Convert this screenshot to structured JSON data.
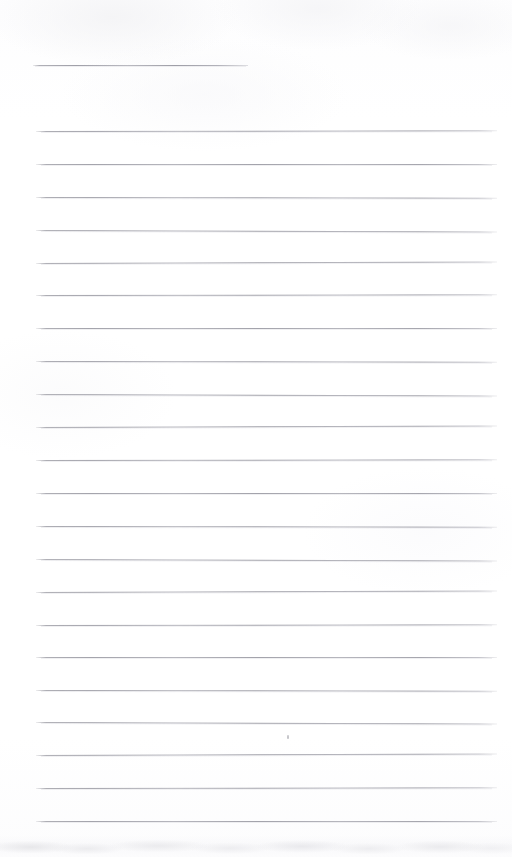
{
  "document": {
    "kind": "scanned-blank-lined-page",
    "page_width": 512,
    "page_height": 857,
    "paper_color": "#ffffff",
    "rule_color": "#a4a4ac",
    "text_content": "",
    "visible_text_lines": []
  },
  "ruling": {
    "line_start_x": 36,
    "line_end_x": 497,
    "line_spacing": 32.9,
    "first_full_line_y": 131,
    "full_line_count": 22,
    "line_thickness": 1
  },
  "partial_rule": {
    "label": "short-top-rule",
    "y": 65,
    "start_x": 33,
    "end_x": 248
  },
  "lines": [
    {
      "index": 1,
      "y": 131,
      "x1": 36,
      "x2": 497
    },
    {
      "index": 2,
      "y": 164,
      "x1": 36,
      "x2": 497
    },
    {
      "index": 3,
      "y": 197,
      "x1": 36,
      "x2": 497
    },
    {
      "index": 4,
      "y": 230,
      "x1": 36,
      "x2": 497
    },
    {
      "index": 5,
      "y": 263,
      "x1": 36,
      "x2": 497
    },
    {
      "index": 6,
      "y": 295,
      "x1": 36,
      "x2": 497
    },
    {
      "index": 7,
      "y": 328,
      "x1": 36,
      "x2": 497
    },
    {
      "index": 8,
      "y": 361,
      "x1": 36,
      "x2": 497
    },
    {
      "index": 9,
      "y": 394,
      "x1": 36,
      "x2": 497
    },
    {
      "index": 10,
      "y": 427,
      "x1": 36,
      "x2": 497
    },
    {
      "index": 11,
      "y": 460,
      "x1": 36,
      "x2": 497
    },
    {
      "index": 12,
      "y": 493,
      "x1": 36,
      "x2": 497
    },
    {
      "index": 13,
      "y": 526,
      "x1": 36,
      "x2": 497
    },
    {
      "index": 14,
      "y": 559,
      "x1": 36,
      "x2": 497
    },
    {
      "index": 15,
      "y": 592,
      "x1": 36,
      "x2": 497
    },
    {
      "index": 16,
      "y": 625,
      "x1": 36,
      "x2": 497
    },
    {
      "index": 17,
      "y": 657,
      "x1": 36,
      "x2": 497
    },
    {
      "index": 18,
      "y": 690,
      "x1": 36,
      "x2": 497
    },
    {
      "index": 19,
      "y": 722,
      "x1": 36,
      "x2": 497
    },
    {
      "index": 20,
      "y": 755,
      "x1": 36,
      "x2": 497
    },
    {
      "index": 21,
      "y": 788,
      "x1": 36,
      "x2": 497
    },
    {
      "index": 22,
      "y": 821,
      "x1": 36,
      "x2": 497
    }
  ],
  "marks": [
    {
      "label": "ink-speck",
      "x": 287,
      "y": 735
    }
  ]
}
